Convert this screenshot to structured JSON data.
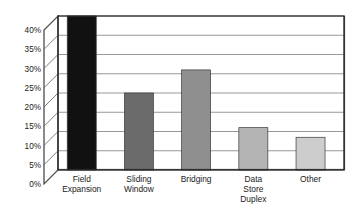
{
  "chart_data": {
    "type": "bar",
    "title": "",
    "subtitle": "",
    "xlabel": "",
    "ylabel": "",
    "categories": [
      "Field Expansion",
      "Sliding Window",
      "Bridging",
      "Data Store Duplex",
      "Other"
    ],
    "category_lines": [
      [
        "Field",
        "Expansion"
      ],
      [
        "Sliding",
        "Window"
      ],
      [
        "Bridging"
      ],
      [
        "Data",
        "Store",
        "Duplex"
      ],
      [
        "Other"
      ]
    ],
    "values": [
      42,
      20,
      26,
      11,
      8.5
    ],
    "value_labels": [
      "42%",
      "20%",
      "26%",
      "11%",
      "8.5%"
    ],
    "bar_colors": [
      "#111111",
      "#6b6b6b",
      "#8f8f8f",
      "#b4b4b4",
      "#cdcdcd"
    ],
    "clipped_bars": [
      true,
      false,
      false,
      false,
      false
    ],
    "ylim": [
      0,
      40
    ],
    "ytick_values": [
      0,
      5,
      10,
      15,
      20,
      25,
      30,
      35,
      40
    ],
    "ytick_labels": [
      "0%",
      "5%",
      "10%",
      "15%",
      "20%",
      "25%",
      "30%",
      "35%",
      "40%"
    ],
    "grid": true,
    "grid_axis": "y",
    "legend": false,
    "legend_position": "none",
    "axis_style": "3d-left-wall",
    "frame_color": "#2a2a2a",
    "grid_color": "#8c8c8c",
    "background": "#ffffff",
    "annotations": []
  }
}
